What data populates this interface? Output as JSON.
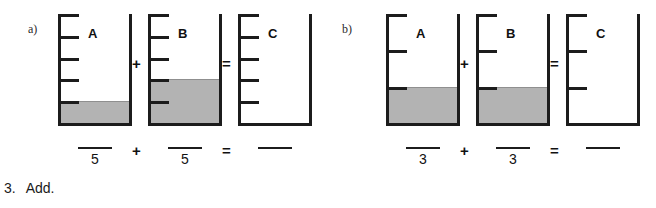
{
  "instruction": {
    "number": "3.",
    "text": "Add."
  },
  "groups": [
    {
      "label": "a)",
      "denominator": "5",
      "divisions": 5,
      "operator_plus": "+",
      "operator_equals": "=",
      "beakers": [
        {
          "letter": "A",
          "filled_units": 1,
          "total_units": 5
        },
        {
          "letter": "B",
          "filled_units": 2,
          "total_units": 5
        },
        {
          "letter": "C",
          "filled_units": 0,
          "total_units": 5
        }
      ],
      "fractions": [
        {
          "numerator": "",
          "denominator": "5"
        },
        {
          "numerator": "",
          "denominator": "5"
        },
        {
          "numerator": "",
          "denominator": ""
        }
      ]
    },
    {
      "label": "b)",
      "denominator": "3",
      "divisions": 3,
      "operator_plus": "+",
      "operator_equals": "=",
      "beakers": [
        {
          "letter": "A",
          "filled_units": 1,
          "total_units": 3
        },
        {
          "letter": "B",
          "filled_units": 1,
          "total_units": 3
        },
        {
          "letter": "C",
          "filled_units": 0,
          "total_units": 3
        }
      ],
      "fractions": [
        {
          "numerator": "",
          "denominator": "3"
        },
        {
          "numerator": "",
          "denominator": "3"
        },
        {
          "numerator": "",
          "denominator": ""
        }
      ]
    }
  ],
  "colors": {
    "ink": "#1c1c1c",
    "liquid": "#b3b3b3",
    "page": "#ffffff"
  }
}
